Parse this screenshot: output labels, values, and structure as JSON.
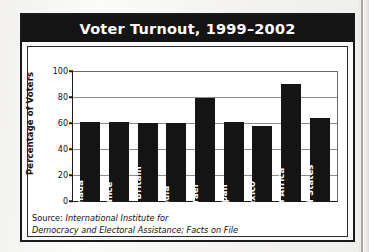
{
  "figure": {
    "title": "Voter Turnout, 1999–2002",
    "source_lead": "Source: ",
    "source_line1": "International Institute for",
    "source_line2": "Democracy and Electoral Assistance; Facts on File"
  },
  "colors": {
    "title_bar": "#141414",
    "bar_fill": "#141414",
    "gridline": "#8d8d8d",
    "axis": "#1a1a1a",
    "plot_background": "#ffffff",
    "page_background": "#f4f3f1"
  },
  "chart_data": {
    "type": "bar",
    "title": "Voter Turnout, 1999–2002",
    "xlabel": "",
    "ylabel": "Percentage of Voters",
    "ylim": [
      0,
      100
    ],
    "yticks": [
      0,
      20,
      40,
      60,
      80,
      100
    ],
    "ytick_labels": [
      "0",
      "20",
      "40",
      "60",
      "80",
      "100"
    ],
    "grid": true,
    "legend": false,
    "categories": [
      "Canada",
      "France",
      "Great Britain",
      "India",
      "Israel",
      "Japan",
      "Mexico",
      "South Africa",
      "United States"
    ],
    "values": [
      61,
      60.5,
      60,
      60,
      79,
      61,
      58,
      90,
      64
    ],
    "series": [
      {
        "name": "Percentage of Voters",
        "values": [
          61,
          60.5,
          60,
          60,
          79,
          61,
          58,
          90,
          64
        ]
      }
    ]
  }
}
